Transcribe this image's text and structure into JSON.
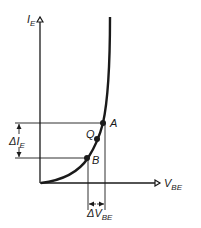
{
  "diagram": {
    "type": "characteristic-curve",
    "y_axis": {
      "label": "I",
      "subscript": "E"
    },
    "x_axis": {
      "label": "V",
      "subscript": "BE"
    },
    "points": [
      {
        "name": "A",
        "label": "A"
      },
      {
        "name": "Q",
        "label": "Q"
      },
      {
        "name": "B",
        "label": "B"
      }
    ],
    "delta_y": {
      "label": "ΔI",
      "subscript": "E"
    },
    "delta_x": {
      "label": "ΔV",
      "subscript": "BE"
    },
    "colors": {
      "line": "#1a1a1a",
      "background": "#ffffff"
    }
  }
}
